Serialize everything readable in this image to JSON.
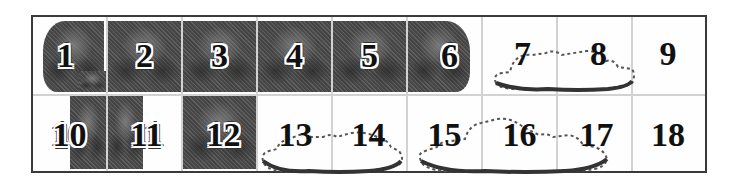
{
  "grid": {
    "columns": 9,
    "rows": 2,
    "frame_color": "#3a3a3a",
    "divider_color": "#d2d2d2",
    "fill_color": "#4f4f4f"
  },
  "tiles": [
    {
      "label": "1",
      "type": "dark",
      "row": 0,
      "col": 0
    },
    {
      "label": "2",
      "type": "dark",
      "row": 0,
      "col": 1
    },
    {
      "label": "3",
      "type": "dark",
      "row": 0,
      "col": 2
    },
    {
      "label": "4",
      "type": "dark",
      "row": 0,
      "col": 3
    },
    {
      "label": "5",
      "type": "dark",
      "row": 0,
      "col": 4
    },
    {
      "label": "6",
      "type": "dark",
      "row": 0,
      "col": 5
    },
    {
      "label": "7",
      "type": "cloud",
      "row": 0,
      "col": 6
    },
    {
      "label": "8",
      "type": "cloud",
      "row": 0,
      "col": 7
    },
    {
      "label": "9",
      "type": "empty",
      "row": 0,
      "col": 8
    },
    {
      "label": "10",
      "type": "dark",
      "row": 1,
      "col": 0
    },
    {
      "label": "11",
      "type": "dark",
      "row": 1,
      "col": 1
    },
    {
      "label": "12",
      "type": "dark",
      "row": 1,
      "col": 2
    },
    {
      "label": "13",
      "type": "cloud",
      "row": 1,
      "col": 3
    },
    {
      "label": "14",
      "type": "cloud",
      "row": 1,
      "col": 4
    },
    {
      "label": "15",
      "type": "cloud",
      "row": 1,
      "col": 5
    },
    {
      "label": "16",
      "type": "cloud",
      "row": 1,
      "col": 6
    },
    {
      "label": "17",
      "type": "cloud",
      "row": 1,
      "col": 7
    },
    {
      "label": "18",
      "type": "empty",
      "row": 1,
      "col": 8
    }
  ]
}
